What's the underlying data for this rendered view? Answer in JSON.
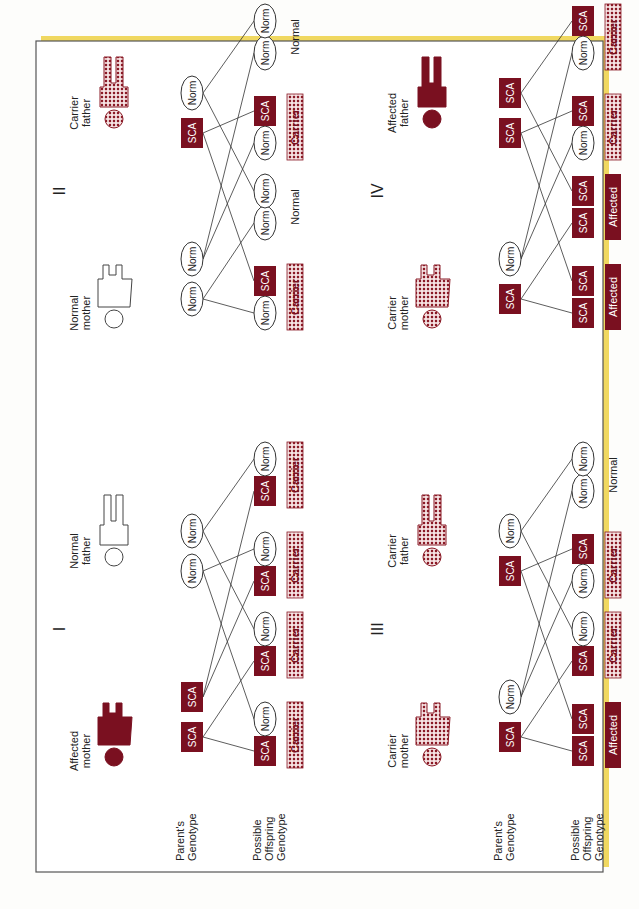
{
  "colors": {
    "affected": "#7a1020",
    "carrier_dot": "#8a1a26",
    "carrier_bg": "#f3dede",
    "frame": "#555555",
    "shadow": "#f0d860",
    "line": "#333333",
    "text": "#222222"
  },
  "row_labels": {
    "parents_genotype": [
      "Parent's",
      "Genotype"
    ],
    "offspring_genotype": [
      "Possible",
      "Offspring",
      "Genotype"
    ]
  },
  "panels": [
    {
      "numeral": "I",
      "mother": {
        "label": [
          "Affected",
          "mother"
        ],
        "status": "affected",
        "genes": [
          "SCA",
          "SCA"
        ]
      },
      "father": {
        "label": [
          "Normal",
          "father"
        ],
        "status": "normal",
        "genes": [
          "Norm",
          "Norm"
        ]
      },
      "offspring": [
        {
          "genes": [
            "SCA",
            "Norm"
          ],
          "result": "Carrier"
        },
        {
          "genes": [
            "SCA",
            "Norm"
          ],
          "result": "Carrier"
        },
        {
          "genes": [
            "SCA",
            "Norm"
          ],
          "result": "Carrier"
        },
        {
          "genes": [
            "SCA",
            "Norm"
          ],
          "result": "Carrier"
        }
      ]
    },
    {
      "numeral": "II",
      "mother": {
        "label": [
          "Normal",
          "mother"
        ],
        "status": "normal",
        "genes": [
          "Norm",
          "Norm"
        ]
      },
      "father": {
        "label": [
          "Carrier",
          "father"
        ],
        "status": "carrier",
        "genes": [
          "SCA",
          "Norm"
        ]
      },
      "offspring": [
        {
          "genes": [
            "Norm",
            "SCA"
          ],
          "result": "Carrier"
        },
        {
          "genes": [
            "Norm",
            "Norm"
          ],
          "result": "Normal"
        },
        {
          "genes": [
            "Norm",
            "SCA"
          ],
          "result": "Carrier"
        },
        {
          "genes": [
            "Norm",
            "Norm"
          ],
          "result": "Normal"
        }
      ]
    },
    {
      "numeral": "III",
      "mother": {
        "label": [
          "Carrier",
          "mother"
        ],
        "status": "carrier",
        "genes": [
          "SCA",
          "Norm"
        ]
      },
      "father": {
        "label": [
          "Carrier",
          "father"
        ],
        "status": "carrier",
        "genes": [
          "SCA",
          "Norm"
        ]
      },
      "offspring": [
        {
          "genes": [
            "SCA",
            "SCA"
          ],
          "result": "Affected"
        },
        {
          "genes": [
            "SCA",
            "Norm"
          ],
          "result": "Carrier"
        },
        {
          "genes": [
            "Norm",
            "SCA"
          ],
          "result": "Carrier"
        },
        {
          "genes": [
            "Norm",
            "Norm"
          ],
          "result": "Normal"
        }
      ]
    },
    {
      "numeral": "IV",
      "mother": {
        "label": [
          "Carrier",
          "mother"
        ],
        "status": "carrier",
        "genes": [
          "SCA",
          "Norm"
        ]
      },
      "father": {
        "label": [
          "Affected",
          "father"
        ],
        "status": "affected",
        "genes": [
          "SCA",
          "SCA"
        ]
      },
      "offspring": [
        {
          "genes": [
            "SCA",
            "SCA"
          ],
          "result": "Affected"
        },
        {
          "genes": [
            "SCA",
            "SCA"
          ],
          "result": "Affected"
        },
        {
          "genes": [
            "Norm",
            "SCA"
          ],
          "result": "Carrier"
        },
        {
          "genes": [
            "Norm",
            "SCA"
          ],
          "result": "Carrier"
        }
      ]
    }
  ]
}
